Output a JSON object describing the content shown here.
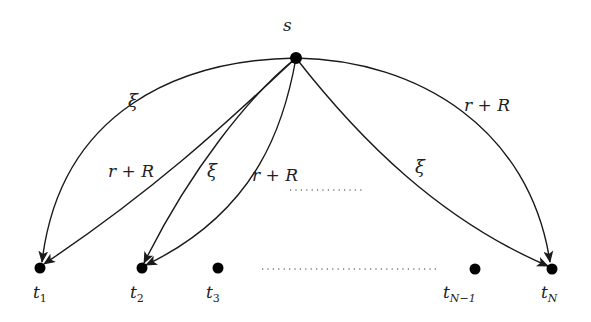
{
  "diagram": {
    "type": "directed-graph",
    "colors": {
      "stroke": "#1a1a1a",
      "node": "#000000",
      "background": "#ffffff"
    },
    "source": {
      "id": "s",
      "label": "s",
      "x": 296,
      "y": 58
    },
    "targets": [
      {
        "id": "t1",
        "label": "t",
        "sub": "1",
        "x": 40,
        "y": 268
      },
      {
        "id": "t2",
        "label": "t",
        "sub": "2",
        "x": 142,
        "y": 268
      },
      {
        "id": "t3",
        "label": "t",
        "sub": "3",
        "x": 218,
        "y": 268
      },
      {
        "id": "tN-1",
        "label": "t",
        "sub": "N−1",
        "x": 475,
        "y": 268
      },
      {
        "id": "tN",
        "label": "t",
        "sub": "N",
        "x": 552,
        "y": 268
      }
    ],
    "edges": [
      {
        "from": "s",
        "to": "t1",
        "label": "ξ"
      },
      {
        "from": "s",
        "to": "t1",
        "label": "r + R"
      },
      {
        "from": "s",
        "to": "t2",
        "label": "ξ"
      },
      {
        "from": "s",
        "to": "t2",
        "label": "r + R"
      },
      {
        "from": "s",
        "to": "tN",
        "label": "ξ"
      },
      {
        "from": "s",
        "to": "tN",
        "label": "r + R"
      }
    ],
    "edge_labels": {
      "xi_t1": "ξ",
      "rR_t1": "r + R",
      "xi_t2": "ξ",
      "rR_t2": "r + R",
      "xi_tN": "ξ",
      "rR_tN": "r + R"
    },
    "ellipses": [
      "edges continue (dotted)",
      "targets continue (dotted)"
    ]
  }
}
